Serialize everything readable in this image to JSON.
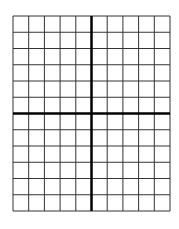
{
  "diagram": {
    "type": "coordinate-grid",
    "columns": 10,
    "rows": 12,
    "y_axis_after_column": 5,
    "x_axis_after_row": 6,
    "left": 13,
    "top": 16,
    "right": 170,
    "bottom": 211,
    "grid_color": "#333333",
    "axis_color": "#000000",
    "background": "#ffffff"
  }
}
